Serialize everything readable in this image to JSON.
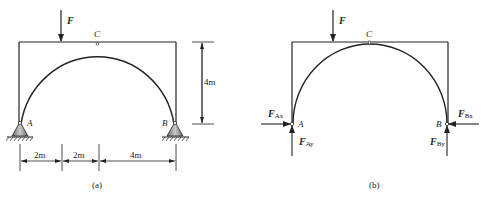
{
  "figure_a": {
    "caption": "(a)",
    "load_label": "F",
    "hinge_label": "C",
    "support_left_label": "A",
    "support_right_label": "B",
    "height_dimension": "4m",
    "span_dimensions": [
      "2m",
      "2m",
      "4m"
    ]
  },
  "figure_b": {
    "caption": "(b)",
    "load_label": "F",
    "hinge_label": "C",
    "point_left_label": "A",
    "point_right_label": "B",
    "reactions": {
      "FAx": {
        "main": "F",
        "sub": "Ax"
      },
      "FAy": {
        "main": "F",
        "sub": "Ay"
      },
      "FBx": {
        "main": "F",
        "sub": "Bx"
      },
      "FBy": {
        "main": "F",
        "sub": "By"
      }
    }
  },
  "colors": {
    "line": "#222222",
    "support_fill": "#9a9a9a"
  }
}
